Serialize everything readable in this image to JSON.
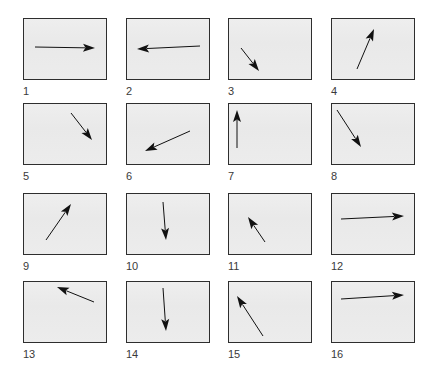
{
  "figure": {
    "background": "#ffffff",
    "panel_fill": "#ececec",
    "panel_border": "#2e2e2e",
    "arrow_color": "#111111",
    "panels": [
      {
        "label": "1",
        "x": 23,
        "y": 18,
        "arrow": {
          "x1": 35,
          "y1": 47,
          "x2": 95,
          "y2": 48
        }
      },
      {
        "label": "2",
        "x": 126,
        "y": 18,
        "arrow": {
          "x1": 200,
          "y1": 46,
          "x2": 137,
          "y2": 49
        }
      },
      {
        "label": "3",
        "x": 228,
        "y": 18,
        "arrow": {
          "x1": 241,
          "y1": 48,
          "x2": 259,
          "y2": 71
        }
      },
      {
        "label": "4",
        "x": 331,
        "y": 18,
        "arrow": {
          "x1": 357,
          "y1": 69,
          "x2": 374,
          "y2": 29
        }
      },
      {
        "label": "5",
        "x": 23,
        "y": 103,
        "arrow": {
          "x1": 71,
          "y1": 113,
          "x2": 92,
          "y2": 140
        }
      },
      {
        "label": "6",
        "x": 126,
        "y": 103,
        "arrow": {
          "x1": 190,
          "y1": 131,
          "x2": 145,
          "y2": 151
        }
      },
      {
        "label": "7",
        "x": 228,
        "y": 103,
        "arrow": {
          "x1": 237,
          "y1": 148,
          "x2": 237,
          "y2": 110
        }
      },
      {
        "label": "8",
        "x": 331,
        "y": 103,
        "arrow": {
          "x1": 337,
          "y1": 110,
          "x2": 361,
          "y2": 147
        }
      },
      {
        "label": "9",
        "x": 23,
        "y": 193,
        "arrow": {
          "x1": 46,
          "y1": 240,
          "x2": 71,
          "y2": 204
        }
      },
      {
        "label": "10",
        "x": 126,
        "y": 193,
        "arrow": {
          "x1": 163,
          "y1": 202,
          "x2": 166,
          "y2": 240
        }
      },
      {
        "label": "11",
        "x": 228,
        "y": 193,
        "arrow": {
          "x1": 265,
          "y1": 242,
          "x2": 248,
          "y2": 217
        }
      },
      {
        "label": "12",
        "x": 331,
        "y": 193,
        "arrow": {
          "x1": 341,
          "y1": 219,
          "x2": 404,
          "y2": 216
        }
      },
      {
        "label": "13",
        "x": 23,
        "y": 281,
        "arrow": {
          "x1": 94,
          "y1": 302,
          "x2": 57,
          "y2": 287
        }
      },
      {
        "label": "14",
        "x": 126,
        "y": 281,
        "arrow": {
          "x1": 163,
          "y1": 288,
          "x2": 166,
          "y2": 331
        }
      },
      {
        "label": "15",
        "x": 228,
        "y": 281,
        "arrow": {
          "x1": 263,
          "y1": 336,
          "x2": 237,
          "y2": 296
        }
      },
      {
        "label": "16",
        "x": 331,
        "y": 281,
        "arrow": {
          "x1": 341,
          "y1": 299,
          "x2": 404,
          "y2": 295
        }
      }
    ]
  }
}
